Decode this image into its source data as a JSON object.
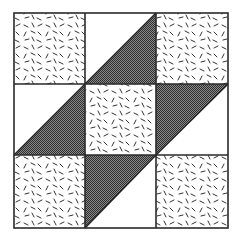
{
  "diagram": {
    "type": "quilt-block",
    "grid": {
      "rows": 3,
      "cols": 3
    },
    "colors": {
      "background": "#ffffff",
      "line": "#2a2a2a",
      "dark_fill": "#5a5a5a",
      "speckle": "#333333"
    },
    "cells": [
      {
        "row": 0,
        "col": 0,
        "fill": "speckled"
      },
      {
        "row": 0,
        "col": 1,
        "fill": "half-triangle",
        "dark": "lower-right"
      },
      {
        "row": 0,
        "col": 2,
        "fill": "speckled"
      },
      {
        "row": 1,
        "col": 0,
        "fill": "half-triangle",
        "dark": "lower-right"
      },
      {
        "row": 1,
        "col": 1,
        "fill": "speckled"
      },
      {
        "row": 1,
        "col": 2,
        "fill": "half-triangle",
        "dark": "upper-left"
      },
      {
        "row": 2,
        "col": 0,
        "fill": "speckled"
      },
      {
        "row": 2,
        "col": 1,
        "fill": "half-triangle",
        "dark": "upper-left"
      },
      {
        "row": 2,
        "col": 2,
        "fill": "speckled"
      }
    ]
  }
}
